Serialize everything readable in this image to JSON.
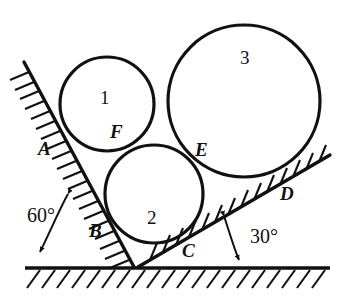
{
  "figure": {
    "background_color": "#ffffff",
    "stroke_color": "#111111",
    "width": 346,
    "height": 301,
    "circles": [
      {
        "id": "circle-1",
        "label": "1",
        "cx": 107,
        "cy": 104,
        "r": 47,
        "label_x": 100,
        "label_y": 88
      },
      {
        "id": "circle-2",
        "label": "2",
        "cx": 154,
        "cy": 194,
        "r": 49,
        "label_x": 147,
        "label_y": 208
      },
      {
        "id": "circle-3",
        "label": "3",
        "cx": 244,
        "cy": 101,
        "r": 76,
        "label_x": 240,
        "label_y": 48
      }
    ],
    "points": [
      {
        "id": "point-A",
        "label": "A",
        "x": 38,
        "y": 139
      },
      {
        "id": "point-B",
        "label": "B",
        "x": 89,
        "y": 221
      },
      {
        "id": "point-C",
        "label": "C",
        "x": 182,
        "y": 241
      },
      {
        "id": "point-D",
        "label": "D",
        "x": 280,
        "y": 184
      },
      {
        "id": "point-E",
        "label": "E",
        "x": 195,
        "y": 140
      },
      {
        "id": "point-F",
        "label": "F",
        "x": 110,
        "y": 122
      }
    ],
    "angles": [
      {
        "id": "angle-left",
        "label": "60°",
        "x": 27,
        "y": 205
      },
      {
        "id": "angle-right",
        "label": "30°",
        "x": 250,
        "y": 226
      }
    ],
    "ground": {
      "x1": 25,
      "y1": 268,
      "x2": 330,
      "y2": 268
    },
    "incline_left": {
      "x1": 24,
      "y1": 62,
      "x2": 134,
      "y2": 267
    },
    "incline_right": {
      "x1": 138,
      "y1": 267,
      "x2": 330,
      "y2": 155
    }
  }
}
